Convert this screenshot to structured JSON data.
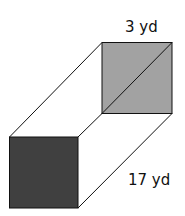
{
  "diagram": {
    "type": "rectangular-prism",
    "labels": {
      "side": "3 yd",
      "length": "17 yd"
    },
    "colors": {
      "front_face": "#404040",
      "back_face": "#a2a2a2",
      "edge": "#111111",
      "background": "#ffffff"
    }
  }
}
